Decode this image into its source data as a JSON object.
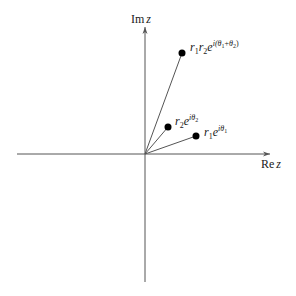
{
  "diagram": {
    "type": "complex-plane-multiplication",
    "axes": {
      "real_label_main": "Re",
      "real_label_var": "z",
      "imag_label_main": "Im",
      "imag_label_var": "z"
    },
    "points": [
      {
        "id": "z1",
        "label": {
          "r": "r",
          "r_sub": "1",
          "e": "e",
          "exp_i": "i",
          "exp_theta": "θ",
          "exp_sub": "1"
        }
      },
      {
        "id": "z2",
        "label": {
          "r": "r",
          "r_sub": "2",
          "e": "e",
          "exp_i": "i",
          "exp_theta": "θ",
          "exp_sub": "2"
        }
      },
      {
        "id": "product",
        "label": {
          "r1": "r",
          "r1_sub": "1",
          "r2": "r",
          "r2_sub": "2",
          "e": "e",
          "exp_open": "i(",
          "theta1": "θ",
          "theta1_sub": "1",
          "plus": "+",
          "theta2": "θ",
          "theta2_sub": "2",
          "exp_close": ")"
        }
      }
    ],
    "colors": {
      "axis": "#555555",
      "point": "#000000",
      "text": "#1a1a1a",
      "background": "#ffffff"
    }
  }
}
